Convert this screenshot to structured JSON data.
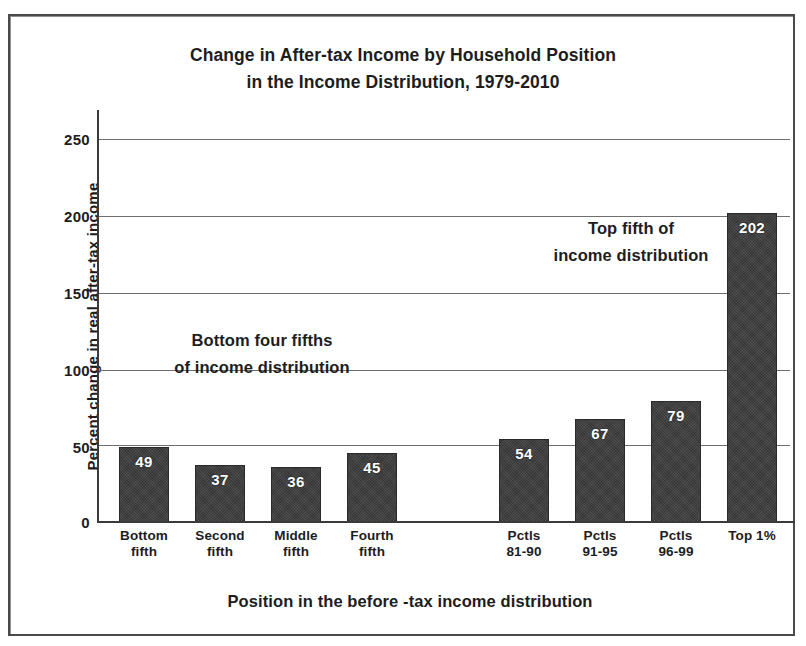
{
  "chart_data": {
    "type": "bar",
    "title": "Change in After-tax Income by Household Position in the Income Distribution, 1979-2010",
    "title_line1": "Change in After-tax Income by Household Position",
    "title_line2": "in the Income Distribution, 1979-2010",
    "xlabel": "Position in the before -tax income distribution",
    "ylabel": "Percent change in real after-tax income",
    "ylim": [
      0,
      250
    ],
    "yticks": [
      0,
      50,
      100,
      150,
      200,
      250
    ],
    "ytick_labels": [
      "0",
      "50",
      "100",
      "150",
      "200",
      "250"
    ],
    "grid": true,
    "legend": false,
    "categories": [
      "Bottom fifth",
      "Second fifth",
      "Middle fifth",
      "Fourth fifth",
      "",
      "Pctls 81-90",
      "Pctls 91-95",
      "Pctls 96-99",
      "Top 1%"
    ],
    "category_lines": [
      [
        "Bottom",
        "fifth"
      ],
      [
        "Second",
        "fifth"
      ],
      [
        "Middle",
        "fifth"
      ],
      [
        "Fourth",
        "fifth"
      ],
      [
        "",
        ""
      ],
      [
        "Pctls",
        "81-90"
      ],
      [
        "Pctls",
        "91-95"
      ],
      [
        "Pctls",
        "96-99"
      ],
      [
        "Top 1%",
        ""
      ]
    ],
    "values": [
      49,
      37,
      36,
      45,
      null,
      54,
      67,
      79,
      202
    ],
    "value_labels": [
      "49",
      "37",
      "36",
      "45",
      "",
      "54",
      "67",
      "79",
      "202"
    ],
    "bar_color": "#3c3c3c",
    "bar_label_color": "#ffffff",
    "annotations": [
      {
        "text": "Bottom four fifths of income distribution",
        "line1": "Bottom four fifths",
        "line2": "of income distribution"
      },
      {
        "text": "Top fifth of income distribution",
        "line1": "Top fifth of",
        "line2": "income distribution"
      }
    ]
  }
}
